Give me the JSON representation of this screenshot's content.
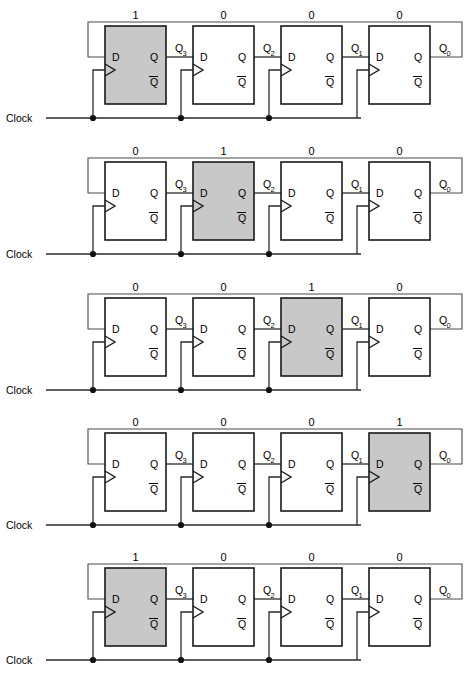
{
  "diagram": {
    "clock_label": "Clock",
    "pin_labels": {
      "d": "D",
      "q": "Q",
      "qbar": "Q"
    },
    "output_labels": [
      {
        "base": "Q",
        "sub": "3"
      },
      {
        "base": "Q",
        "sub": "2"
      },
      {
        "base": "Q",
        "sub": "1"
      },
      {
        "base": "Q",
        "sub": "0"
      }
    ],
    "colors": {
      "active_fill": "#c8c8c8",
      "inactive_fill": "#ffffff",
      "box_stroke": "#1a1a1a",
      "wire": "#2b2b2b",
      "feedback_wire": "#6e6e6e",
      "text": "#000000"
    },
    "stages": [
      {
        "name": "state-1",
        "bits": [
          "1",
          "0",
          "0",
          "0"
        ],
        "active_index": 0
      },
      {
        "name": "state-2",
        "bits": [
          "0",
          "1",
          "0",
          "0"
        ],
        "active_index": 1
      },
      {
        "name": "state-3",
        "bits": [
          "0",
          "0",
          "1",
          "0"
        ],
        "active_index": 2
      },
      {
        "name": "state-4",
        "bits": [
          "0",
          "0",
          "0",
          "1"
        ],
        "active_index": 3
      },
      {
        "name": "state-5",
        "bits": [
          "1",
          "0",
          "0",
          "0"
        ],
        "active_index": 0
      }
    ]
  }
}
